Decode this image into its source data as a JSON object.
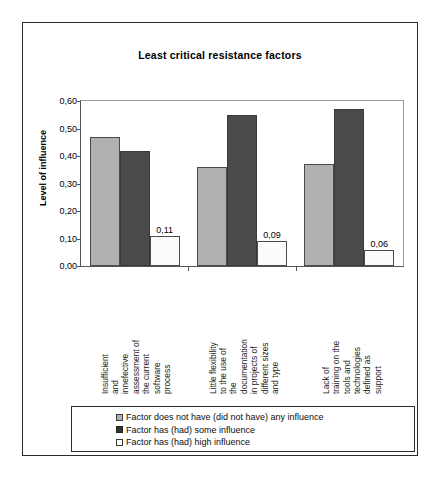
{
  "chart_data": {
    "type": "bar",
    "title": "Least critical resistance factors",
    "xlabel": "",
    "ylabel": "Level of influence",
    "ylim": [
      0,
      0.6
    ],
    "ytick_labels": [
      "0,60",
      "0,50",
      "0,40",
      "0,30",
      "0,20",
      "0,10",
      "0,00"
    ],
    "ytick_values": [
      0.6,
      0.5,
      0.4,
      0.3,
      0.2,
      0.1,
      0.0
    ],
    "grid": false,
    "legend_position": "bottom",
    "decimal_separator": ",",
    "categories": [
      "Insufficient and innefective assessment of the current software process",
      "Little flexibility to the use of the documentation in projects of different sizes and type",
      "Lack of training on the tools and technologies defined as support"
    ],
    "category_lines": [
      [
        "Insufficient",
        "and",
        "innefective",
        "assessment of",
        "the current",
        "software",
        "process"
      ],
      [
        "Little flexibility",
        "to the use of",
        "the",
        "documentation",
        "in projects of",
        "different sizes",
        "and type"
      ],
      [
        "Lack of",
        "training on the",
        "tools and",
        "technologies",
        "defined as",
        "support"
      ]
    ],
    "series": [
      {
        "name": "Factor does not have (did not have) any influence",
        "key": "none",
        "color": "#b0b0b0",
        "values": [
          0.47,
          0.36,
          0.37
        ],
        "labels": [
          "",
          "",
          ""
        ]
      },
      {
        "name": "Factor has (had) some influence",
        "key": "some",
        "color": "#4a4a4a",
        "values": [
          0.42,
          0.55,
          0.57
        ],
        "labels": [
          "",
          "",
          ""
        ]
      },
      {
        "name": "Factor has (had) high influence",
        "key": "high",
        "color": "#ffffff",
        "values": [
          0.11,
          0.09,
          0.06
        ],
        "labels": [
          "0,11",
          "0,09",
          "0,06"
        ]
      }
    ]
  },
  "legend": {
    "items": [
      {
        "label": "Factor does not have (did not have) any influence",
        "key": "none"
      },
      {
        "label": "Factor has (had) some influence",
        "key": "some"
      },
      {
        "label": "Factor has (had) high influence",
        "key": "high"
      }
    ]
  }
}
